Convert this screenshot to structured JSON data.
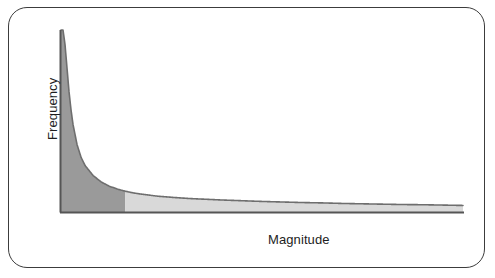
{
  "figure": {
    "frame_color": "#3c3c3c",
    "background_color": "#ffffff"
  },
  "chart_data": {
    "type": "area",
    "title": "",
    "subtitle": "",
    "xlabel": "Magnitude",
    "ylabel": "Frequency",
    "grid": false,
    "legend": false,
    "legend_position": "none",
    "annotations": [],
    "axis_color": "#555555",
    "curve_color": "#6e6e6e",
    "xlim": [
      0,
      100
    ],
    "ylim": [
      0,
      100
    ],
    "x_tick_labels": [],
    "y_tick_labels": [],
    "series": [
      {
        "name": "Frequency",
        "fill_split_x": 16,
        "x": [
          0.5,
          1,
          1.5,
          2,
          2.5,
          3,
          4,
          5,
          6,
          8,
          10,
          12,
          14,
          16,
          18,
          20,
          24,
          28,
          32,
          36,
          40,
          45,
          50,
          55,
          60,
          65,
          70,
          75,
          80,
          85,
          90,
          95,
          100
        ],
        "y": [
          100,
          92,
          79,
          66,
          56,
          48,
          37,
          30,
          25.5,
          20,
          16.5,
          14.2,
          12.6,
          11.4,
          10.5,
          9.8,
          8.7,
          8.0,
          7.4,
          7.0,
          6.6,
          6.2,
          5.8,
          5.5,
          5.2,
          5.0,
          4.7,
          4.5,
          4.3,
          4.1,
          4.0,
          3.8,
          3.6
        ]
      }
    ],
    "regions": [
      {
        "name": "head-region",
        "label": "",
        "x_start": 0,
        "x_end": 16,
        "color": "#9a9a9a"
      },
      {
        "name": "tail-region",
        "label": "",
        "x_start": 16,
        "x_end": 100,
        "color": "#d9d9d9"
      }
    ]
  }
}
